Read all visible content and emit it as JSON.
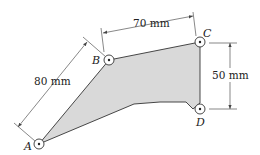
{
  "diagram": {
    "points": {
      "A": {
        "label": "A",
        "x": 39,
        "y": 144
      },
      "B": {
        "label": "B",
        "x": 109,
        "y": 60
      },
      "C": {
        "label": "C",
        "x": 200,
        "y": 42
      },
      "D": {
        "label": "D",
        "x": 200,
        "y": 109
      }
    },
    "dimensions": {
      "AB": "80 mm",
      "BC": "70 mm",
      "CD": "50 mm"
    },
    "colors": {
      "plate_fill": "#d9d9d9",
      "outline": "#333333",
      "dimension_line": "#555555"
    }
  }
}
